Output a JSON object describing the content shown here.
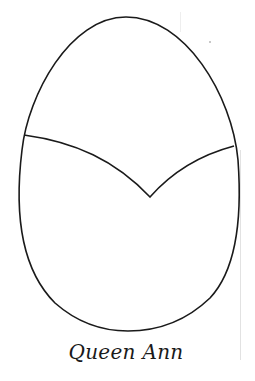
{
  "figure": {
    "caption": "Queen Ann",
    "stroke_color": "#1a1a1a",
    "background": "#ffffff",
    "egg_outline": {
      "top": [
        126,
        17
      ],
      "left_widest": [
        17,
        200
      ],
      "right_widest": [
        239,
        200
      ],
      "bottom": [
        128,
        330
      ]
    },
    "cut_line": {
      "left_point": [
        25,
        135
      ],
      "v_vertex": [
        150,
        197
      ],
      "right_point": [
        233,
        146
      ]
    }
  }
}
